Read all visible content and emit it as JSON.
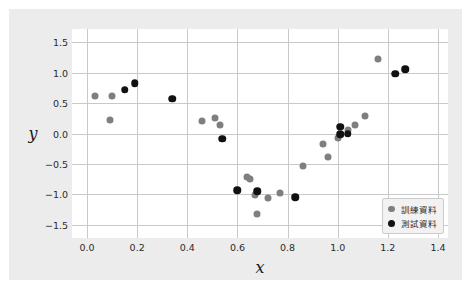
{
  "chart_data": {
    "type": "scatter",
    "title": "",
    "xlabel": "x",
    "ylabel": "y",
    "xlim": [
      -0.06,
      1.44
    ],
    "ylim": [
      -1.72,
      1.72
    ],
    "xticks": [
      "0.0",
      "0.2",
      "0.4",
      "0.6",
      "0.8",
      "1.0",
      "1.2",
      "1.4"
    ],
    "xtick_values": [
      0.0,
      0.2,
      0.4,
      0.6,
      0.8,
      1.0,
      1.2,
      1.4
    ],
    "yticks": [
      "1.5",
      "1.0",
      "0.5",
      "0.0",
      "−0.5",
      "−1.0",
      "−1.5"
    ],
    "ytick_values": [
      1.5,
      1.0,
      0.5,
      0.0,
      -0.5,
      -1.0,
      -1.5
    ],
    "grid": true,
    "legend_position": "lower right",
    "series": [
      {
        "name": "訓練資料",
        "marker_color": "#7f7f7f",
        "points": [
          [
            0.03,
            0.61
          ],
          [
            0.09,
            0.22
          ],
          [
            0.1,
            0.61
          ],
          [
            0.46,
            0.2
          ],
          [
            0.51,
            0.26
          ],
          [
            0.53,
            0.14
          ],
          [
            0.64,
            -0.72
          ],
          [
            0.65,
            -0.75
          ],
          [
            0.67,
            -1.02
          ],
          [
            0.68,
            -1.32
          ],
          [
            0.72,
            -1.06
          ],
          [
            0.77,
            -0.98
          ],
          [
            0.86,
            -0.54
          ],
          [
            0.94,
            -0.17
          ],
          [
            0.96,
            -0.39
          ],
          [
            1.0,
            -0.07
          ],
          [
            1.04,
            0.05
          ],
          [
            1.07,
            0.14
          ],
          [
            1.11,
            0.29
          ],
          [
            1.16,
            1.22
          ]
        ]
      },
      {
        "name": "測試資料",
        "marker_color": "#111111",
        "points": [
          [
            0.15,
            0.72
          ],
          [
            0.19,
            0.83
          ],
          [
            0.34,
            0.57
          ],
          [
            0.54,
            -0.09
          ],
          [
            0.6,
            -0.93
          ],
          [
            0.68,
            -0.95
          ],
          [
            0.83,
            -1.05
          ],
          [
            1.01,
            0.11
          ],
          [
            1.01,
            -0.01
          ],
          [
            1.04,
            0.0
          ],
          [
            1.23,
            0.98
          ],
          [
            1.27,
            1.06
          ]
        ]
      }
    ]
  },
  "legend": {
    "entries": [
      {
        "label": "訓練資料",
        "marker": "train"
      },
      {
        "label": "測試資料",
        "marker": "test"
      }
    ]
  },
  "colors": {
    "figure_background": "#ececec",
    "axes_background": "#ffffff",
    "grid": "#c9c9c9",
    "train_marker": "#7f7f7f",
    "test_marker": "#111111",
    "tick_text": "#2b2b2b"
  }
}
